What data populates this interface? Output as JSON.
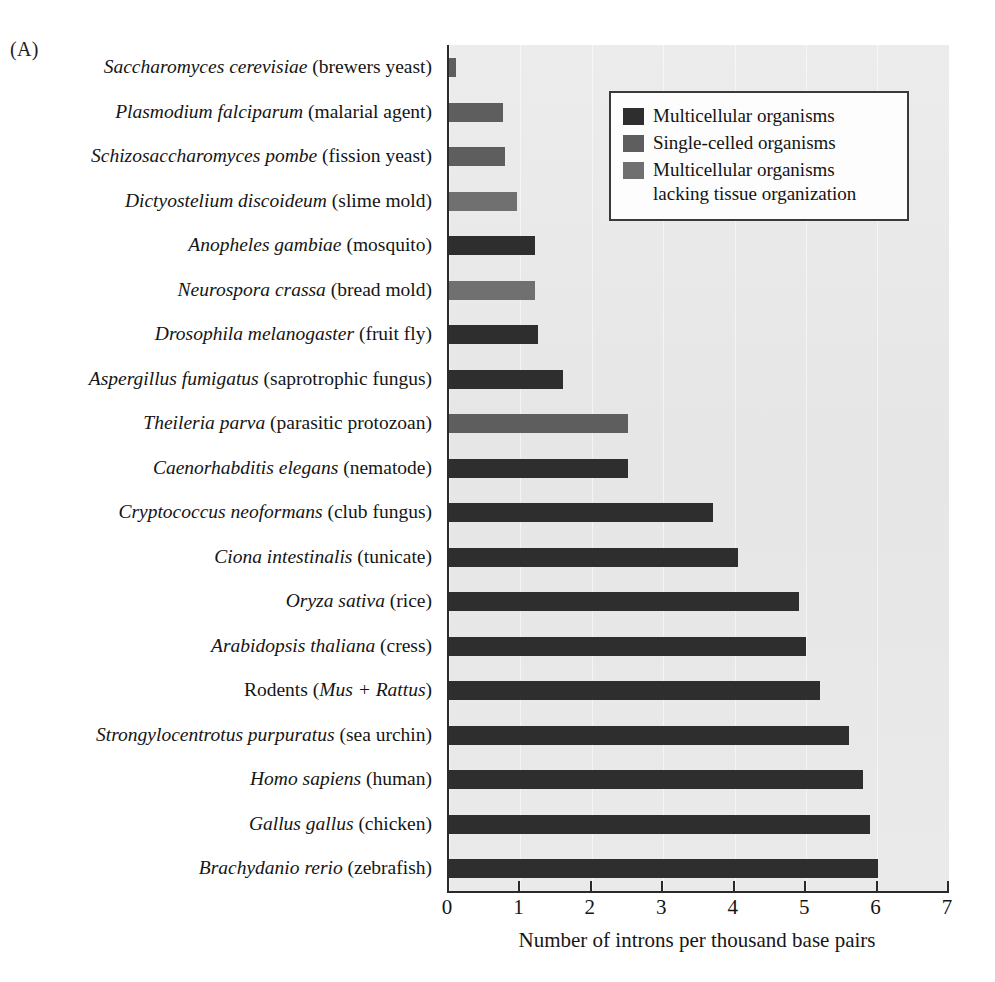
{
  "figure": {
    "panel_label": "(A)",
    "axis_title": "Number of introns per thousand base pairs"
  },
  "legend": {
    "items": [
      {
        "label": "Multicellular organisms",
        "color": "#2e2e2e",
        "key": "multicellular"
      },
      {
        "label": "Single-celled organisms",
        "color": "#5e5e5e",
        "key": "single-celled"
      },
      {
        "label": "Multicellular organisms lacking tissue organization",
        "color": "#707070",
        "key": "multicellular-no-tissue"
      }
    ]
  },
  "chart_data": {
    "type": "bar",
    "orientation": "horizontal",
    "title": "",
    "xlabel": "Number of introns per thousand base pairs",
    "ylabel": "",
    "xlim": [
      0,
      7
    ],
    "xticks": [
      0,
      1,
      2,
      3,
      4,
      5,
      6,
      7
    ],
    "xtick_labels": [
      "0",
      "1",
      "2",
      "3",
      "4",
      "5",
      "6",
      "7"
    ],
    "grid": false,
    "legend_position": "top-right",
    "categories": [
      "Saccharomyces cerevisiae (brewers yeast)",
      "Plasmodium falciparum (malarial agent)",
      "Schizosaccharomyces pombe (fission yeast)",
      "Dictyostelium discoideum (slime mold)",
      "Anopheles gambiae (mosquito)",
      "Neurospora crassa (bread mold)",
      "Drosophila melanogaster (fruit fly)",
      "Aspergillus fumigatus (saprotrophic fungus)",
      "Theileria parva (parasitic protozoan)",
      "Caenorhabditis elegans (nematode)",
      "Cryptococcus neoformans (club fungus)",
      "Ciona intestinalis (tunicate)",
      "Oryza sativa (rice)",
      "Arabidopsis thaliana (cress)",
      "Rodents (Mus + Rattus)",
      "Strongylocentrotus purpuratus (sea urchin)",
      "Homo sapiens (human)",
      "Gallus gallus (chicken)",
      "Brachydanio rerio (zebrafish)"
    ],
    "values": [
      0.1,
      0.75,
      0.78,
      0.95,
      1.2,
      1.2,
      1.25,
      1.6,
      2.5,
      2.5,
      3.7,
      4.05,
      4.9,
      5.0,
      5.2,
      5.6,
      5.8,
      5.9,
      6.0
    ],
    "groups": [
      "single-celled",
      "single-celled",
      "single-celled",
      "multicellular-no-tissue",
      "multicellular",
      "multicellular-no-tissue",
      "multicellular",
      "multicellular",
      "single-celled",
      "multicellular",
      "multicellular",
      "multicellular",
      "multicellular",
      "multicellular",
      "multicellular",
      "multicellular",
      "multicellular",
      "multicellular",
      "multicellular"
    ],
    "category_labels_rich": [
      {
        "italic": "Saccharomyces cerevisiae",
        "plain": " (brewers yeast)"
      },
      {
        "italic": "Plasmodium falciparum",
        "plain": " (malarial agent)"
      },
      {
        "italic": "Schizosaccharomyces pombe",
        "plain": " (fission yeast)"
      },
      {
        "italic": "Dictyostelium discoideum",
        "plain": " (slime mold)"
      },
      {
        "italic": "Anopheles gambiae",
        "plain": " (mosquito)"
      },
      {
        "italic": "Neurospora crassa",
        "plain": " (bread mold)"
      },
      {
        "italic": "Drosophila melanogaster",
        "plain": " (fruit fly)"
      },
      {
        "italic": "Aspergillus fumigatus",
        "plain": " (saprotrophic fungus)"
      },
      {
        "italic": "Theileria parva",
        "plain": " (parasitic protozoan)"
      },
      {
        "italic": "Caenorhabditis elegans",
        "plain": " (nematode)"
      },
      {
        "italic": "Cryptococcus neoformans",
        "plain": " (club fungus)"
      },
      {
        "italic": "Ciona intestinalis",
        "plain": " (tunicate)"
      },
      {
        "italic": "Oryza sativa",
        "plain": " (rice)"
      },
      {
        "italic": "Arabidopsis thaliana",
        "plain": " (cress)"
      },
      {
        "pre": "Rodents (",
        "italic": "Mus + Rattus",
        "plain": ")"
      },
      {
        "italic": "Strongylocentrotus purpuratus",
        "plain": " (sea urchin)"
      },
      {
        "italic": "Homo sapiens",
        "plain": " (human)"
      },
      {
        "italic": "Gallus gallus",
        "plain": " (chicken)"
      },
      {
        "italic": "Brachydanio rerio",
        "plain": " (zebrafish)"
      }
    ],
    "group_colors": {
      "multicellular": "#2e2e2e",
      "single-celled": "#5e5e5e",
      "multicellular-no-tissue": "#707070"
    }
  }
}
